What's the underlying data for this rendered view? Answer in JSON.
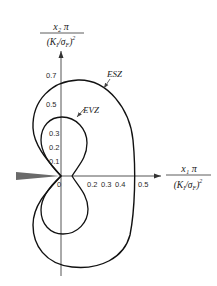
{
  "diagram": {
    "y_axis_label": {
      "numerator": "x₂ π",
      "denominator_left": "(K",
      "denominator_sub": "I",
      "denominator_mid": "/σ",
      "denominator_sub2": "F",
      "denominator_right": ")",
      "exponent": "2"
    },
    "x_axis_label": {
      "numerator": "x₁ π",
      "denominator_left": "(K",
      "denominator_sub": "I",
      "denominator_mid": "/σ",
      "denominator_sub2": "F",
      "denominator_right": ")",
      "exponent": "2"
    },
    "y_ticks": [
      "0.7",
      "0.5",
      "0.3",
      "0.2",
      "0.1"
    ],
    "x_ticks": [
      "0",
      "0.2",
      "0.3",
      "0.4",
      "0.5"
    ],
    "curves": {
      "outer": {
        "label": "ESZ",
        "meaning": "outer zone boundary"
      },
      "inner": {
        "label": "EVZ",
        "meaning": "inner zone boundary"
      }
    },
    "crack": "crack-wedge"
  }
}
